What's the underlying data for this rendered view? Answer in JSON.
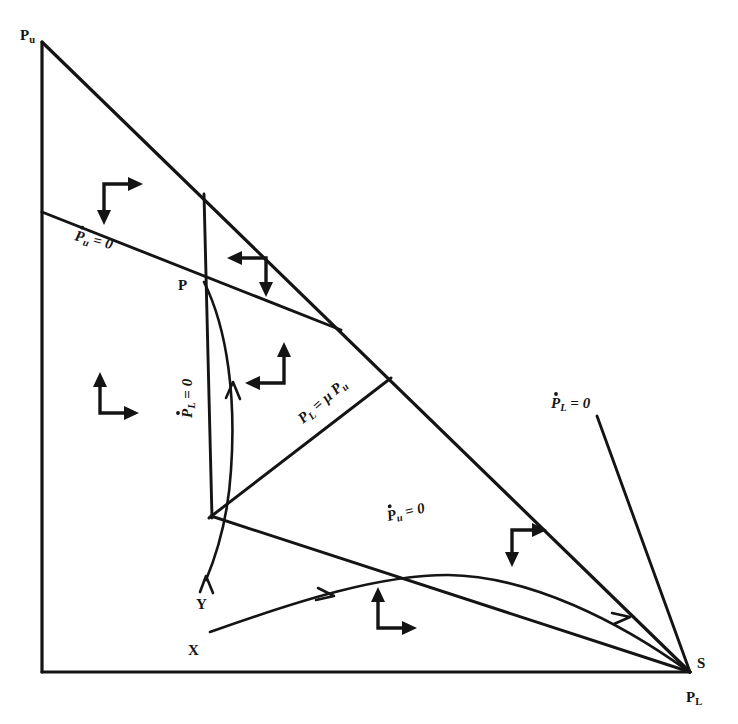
{
  "figure": {
    "type": "phase-plane-diagram",
    "background_color": "#ffffff",
    "line_color": "#141414"
  },
  "corner_labels": {
    "top_left": "Pu",
    "bottom_right": "PL"
  },
  "axis_labels": [
    {
      "name": "vertical-axis-label",
      "text": "Pu",
      "x": 25,
      "y": 38
    },
    {
      "name": "horizontal-axis-label",
      "text": "PL",
      "x": 689,
      "y": 700
    }
  ],
  "points": [
    {
      "name": "point-P",
      "text": "P",
      "x": 182,
      "y": 285
    },
    {
      "name": "point-S",
      "text": "S",
      "x": 700,
      "y": 666
    },
    {
      "name": "point-Y",
      "text": "Y",
      "x": 199,
      "y": 605
    },
    {
      "name": "point-X",
      "text": "X",
      "x": 190,
      "y": 652
    }
  ],
  "nullcline_labels": [
    {
      "name": "label-pu-null-upper",
      "text": "Pu = 0",
      "x": 75,
      "y": 238,
      "rotate": 14,
      "dotted": true
    },
    {
      "name": "label-pl-null-vertical",
      "text": "PL = 0",
      "x": 192,
      "y": 412,
      "rotate": -90,
      "dotted": true
    },
    {
      "name": "label-pl-equals-mu-pu",
      "text": "PL = μ Pu",
      "x": 305,
      "y": 420,
      "rotate": -41,
      "dotted": false
    },
    {
      "name": "label-pl-null-right",
      "text": "PL = 0",
      "x": 553,
      "y": 405,
      "rotate": 0,
      "dotted": true
    },
    {
      "name": "label-pu-null-lower",
      "text": "Pu = 0",
      "x": 390,
      "y": 518,
      "rotate": -13,
      "dotted": true
    }
  ],
  "direction_glyphs": [
    {
      "name": "dir-glyph-down-right",
      "x": 104,
      "y": 184,
      "kind": "down-right"
    },
    {
      "name": "dir-glyph-left-down",
      "x": 240,
      "y": 258,
      "kind": "left-down"
    },
    {
      "name": "dir-glyph-up-right",
      "x": 100,
      "y": 385,
      "kind": "up-right"
    },
    {
      "name": "dir-glyph-left-up",
      "x": 258,
      "y": 355,
      "kind": "left-up"
    },
    {
      "name": "dir-glyph-down-right-2",
      "x": 512,
      "y": 530,
      "kind": "down-right"
    },
    {
      "name": "dir-glyph-up-right-2",
      "x": 378,
      "y": 600,
      "kind": "up-right"
    }
  ],
  "chart_data": {
    "type": "line",
    "title": "",
    "xlabel": "PL",
    "ylabel": "Pu",
    "triangle_vertices": [
      [
        42,
        42
      ],
      [
        42,
        672
      ],
      [
        690,
        672
      ]
    ],
    "curves": [
      {
        "name": "hypotenuse",
        "role": "boundary",
        "points": [
          [
            42,
            42
          ],
          [
            690,
            672
          ]
        ]
      },
      {
        "name": "left-axis",
        "role": "boundary",
        "points": [
          [
            42,
            42
          ],
          [
            42,
            672
          ]
        ]
      },
      {
        "name": "bottom-axis",
        "role": "boundary",
        "points": [
          [
            42,
            672
          ],
          [
            690,
            672
          ]
        ]
      },
      {
        "name": "pu-nullcline-upper",
        "role": "nullcline",
        "points": [
          [
            42,
            212
          ],
          [
            340,
            330
          ]
        ]
      },
      {
        "name": "pl-nullcline-vertical",
        "role": "nullcline",
        "points": [
          [
            204,
            194
          ],
          [
            212,
            516
          ]
        ]
      },
      {
        "name": "pl-equals-mu-pu-ray",
        "role": "nullcline",
        "points": [
          [
            390,
            378
          ],
          [
            210,
            517
          ]
        ]
      },
      {
        "name": "pu-nullcline-lower",
        "role": "nullcline",
        "points": [
          [
            212,
            516
          ],
          [
            690,
            672
          ]
        ]
      },
      {
        "name": "pl-nullcline-right",
        "role": "nullcline",
        "points": [
          [
            598,
            418
          ],
          [
            690,
            672
          ]
        ]
      },
      {
        "name": "trajectory-from-Y",
        "role": "trajectory",
        "points": [
          [
            204,
            282
          ],
          [
            232,
            400
          ],
          [
            224,
            505
          ],
          [
            206,
            578
          ]
        ]
      },
      {
        "name": "trajectory-from-X",
        "role": "trajectory",
        "points": [
          [
            210,
            632
          ],
          [
            400,
            575
          ],
          [
            520,
            590
          ],
          [
            690,
            672
          ]
        ]
      }
    ],
    "equilibria": [
      {
        "label": "P",
        "x": 204,
        "y": 282
      },
      {
        "label": "S",
        "x": 690,
        "y": 672
      }
    ],
    "grid": false,
    "legend": false
  }
}
